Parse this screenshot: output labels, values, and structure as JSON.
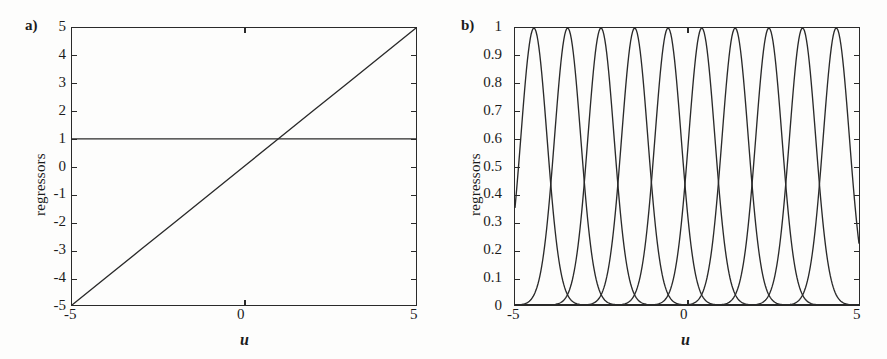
{
  "figure": {
    "panels": [
      {
        "tag": "a)",
        "xlabel": "u",
        "ylabel": "regressors",
        "xticks": [
          "-5",
          "0",
          "5"
        ],
        "yticks": [
          "5",
          "4",
          "3",
          "2",
          "1",
          "0",
          "-1",
          "-2",
          "-3",
          "-4",
          "-5"
        ]
      },
      {
        "tag": "b)",
        "xlabel": "u",
        "ylabel": "regressors",
        "xticks": [
          "-5",
          "0",
          "5"
        ],
        "yticks": [
          "1",
          "0.9",
          "0.8",
          "0.7",
          "0.6",
          "0.5",
          "0.4",
          "0.3",
          "0.2",
          "0.1",
          "0"
        ]
      }
    ]
  },
  "chart_data": [
    {
      "type": "line",
      "panel": "a)",
      "title": "",
      "xlabel": "u",
      "ylabel": "regressors",
      "xlim": [
        -5,
        5
      ],
      "ylim": [
        -5,
        5
      ],
      "xticks": [
        -5,
        0,
        5
      ],
      "yticks": [
        5,
        4,
        3,
        2,
        1,
        0,
        -1,
        -2,
        -3,
        -4,
        -5
      ],
      "grid": false,
      "legend": null,
      "series": [
        {
          "name": "constant regressor (y = 1)",
          "x": [
            -5,
            5
          ],
          "values": [
            1,
            1
          ]
        },
        {
          "name": "linear regressor (y = u)",
          "x": [
            -5,
            -4,
            -3,
            -2,
            -1,
            0,
            1,
            2,
            3,
            4,
            5
          ],
          "values": [
            -5,
            -4,
            -3,
            -2,
            -1,
            0,
            1,
            2,
            3,
            4,
            5
          ]
        }
      ],
      "line_color": "#2a2a2a"
    },
    {
      "type": "line",
      "panel": "b)",
      "title": "",
      "xlabel": "u",
      "ylabel": "regressors",
      "xlim": [
        -5,
        5
      ],
      "ylim": [
        0,
        1
      ],
      "xticks": [
        -5,
        0,
        5
      ],
      "yticks": [
        1,
        0.9,
        0.8,
        0.7,
        0.6,
        0.5,
        0.4,
        0.3,
        0.2,
        0.1,
        0
      ],
      "grid": false,
      "legend": null,
      "basis": "gaussian",
      "n_series": 10,
      "sigma": 0.38,
      "peak_value": 1,
      "edge_value": 0.11,
      "crossing_value": 0.37,
      "centers": [
        -4.45,
        -3.47,
        -2.5,
        -1.52,
        -0.55,
        0.43,
        1.4,
        2.38,
        3.36,
        4.34
      ],
      "series": [
        {
          "name": "phi1",
          "center": -4.45,
          "peak": 1
        },
        {
          "name": "phi2",
          "center": -3.47,
          "peak": 1
        },
        {
          "name": "phi3",
          "center": -2.5,
          "peak": 1
        },
        {
          "name": "phi4",
          "center": -1.52,
          "peak": 1
        },
        {
          "name": "phi5",
          "center": -0.55,
          "peak": 1
        },
        {
          "name": "phi6",
          "center": 0.43,
          "peak": 1
        },
        {
          "name": "phi7",
          "center": 1.4,
          "peak": 1
        },
        {
          "name": "phi8",
          "center": 2.38,
          "peak": 1
        },
        {
          "name": "phi9",
          "center": 3.36,
          "peak": 1
        },
        {
          "name": "phi10",
          "center": 4.34,
          "peak": 1
        }
      ],
      "line_color": "#2a2a2a"
    }
  ]
}
